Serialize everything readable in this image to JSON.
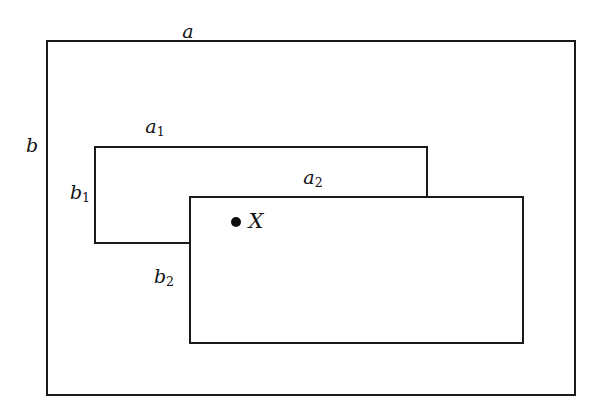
{
  "figure": {
    "type": "set-diagram",
    "background_color": "#ffffff",
    "stroke_color": "#1a1a1a",
    "point_color": "#0d0d0d"
  },
  "rectangles": [
    {
      "id": "outer",
      "width_label": "a",
      "height_label": "b",
      "x": 46,
      "y": 40,
      "w": 530,
      "h": 356
    },
    {
      "id": "middle",
      "width_label": "a",
      "width_label_sub": "1",
      "height_label": "b",
      "height_label_sub": "1",
      "x": 94,
      "y": 146,
      "w": 334,
      "h": 98
    },
    {
      "id": "inner",
      "width_label": "a",
      "width_label_sub": "2",
      "height_label": "b",
      "height_label_sub": "2",
      "x": 189,
      "y": 196,
      "w": 335,
      "h": 148
    }
  ],
  "labels": {
    "a": {
      "text": "a",
      "sub": "",
      "x": 188,
      "y": 31
    },
    "b": {
      "text": "b",
      "sub": "",
      "x": 32,
      "y": 145
    },
    "a1": {
      "text": "a",
      "sub": "1",
      "x": 155,
      "y": 128
    },
    "b1": {
      "text": "b",
      "sub": "1",
      "x": 80,
      "y": 194
    },
    "a2": {
      "text": "a",
      "sub": "2",
      "x": 313,
      "y": 179
    },
    "b2": {
      "text": "b",
      "sub": "2",
      "x": 164,
      "y": 278
    }
  },
  "point": {
    "label": "X",
    "marker": "filled-circle",
    "dot_x": 236,
    "dot_y": 222,
    "label_x": 256,
    "label_y": 221
  }
}
